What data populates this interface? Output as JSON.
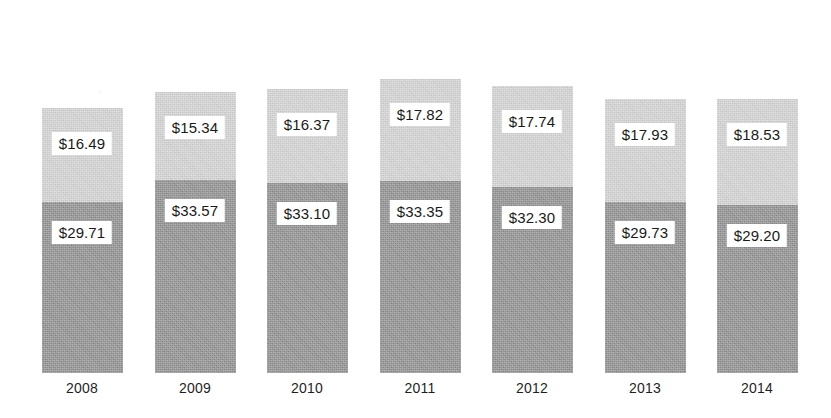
{
  "chart_data": {
    "type": "bar",
    "title": "",
    "subtitle": "",
    "xlabel": "",
    "ylabel": "",
    "stacked": true,
    "grid": false,
    "legend": "none",
    "value_prefix": "$",
    "categories": [
      "2008",
      "2009",
      "2010",
      "2011",
      "2012",
      "2013",
      "2014"
    ],
    "series": [
      {
        "name": "lower-segment",
        "color": "#8e8e8e",
        "values": [
          29.71,
          33.57,
          33.1,
          33.35,
          32.3,
          29.73,
          29.2
        ],
        "labels": [
          "$29.71",
          "$33.57",
          "$33.10",
          "$33.35",
          "$32.30",
          "$29.73",
          "$29.20"
        ]
      },
      {
        "name": "upper-segment",
        "color": "#d2d2d2",
        "values": [
          16.49,
          15.34,
          16.37,
          17.82,
          17.74,
          17.93,
          18.53
        ],
        "labels": [
          "$16.49",
          "$15.34",
          "$16.37",
          "$17.82",
          "$17.74",
          "$17.93",
          "$18.53"
        ]
      }
    ],
    "totals": [
      46.2,
      48.91,
      49.47,
      51.17,
      50.04,
      47.66,
      47.73
    ],
    "ylim": [
      0,
      51.17
    ]
  },
  "axis": {
    "tick_labels": [
      "2008",
      "2009",
      "2010",
      "2011",
      "2012",
      "2013",
      "2014"
    ]
  },
  "cropped_caption": {
    "text": " "
  },
  "colors": {
    "upper": "#d2d2d2",
    "lower": "#8e8e8e",
    "label_box": "#ffffff",
    "text": "#1a1a1a",
    "background": "#ffffff"
  }
}
